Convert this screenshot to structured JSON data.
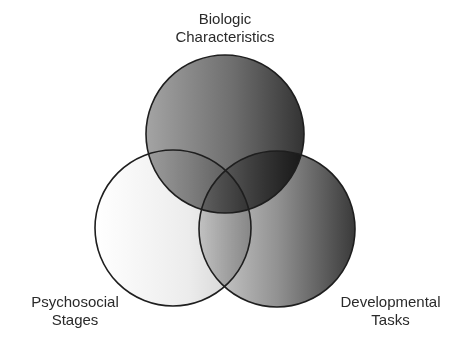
{
  "diagram": {
    "type": "venn",
    "sets": [
      {
        "id": "biologic",
        "label_lines": [
          "Biologic",
          "Characteristics"
        ],
        "position": "top",
        "center": [
          225,
          134
        ],
        "radius": 79,
        "gradient": [
          "#a2a2a2",
          "#353535"
        ]
      },
      {
        "id": "psychosocial",
        "label_lines": [
          "Psychosocial",
          "Stages"
        ],
        "position": "bottom-left",
        "center": [
          173,
          228
        ],
        "radius": 78,
        "gradient": [
          "#ffffff",
          "#cfcfcf"
        ]
      },
      {
        "id": "developmental",
        "label_lines": [
          "Developmental",
          "Tasks"
        ],
        "position": "bottom-right",
        "center": [
          277,
          229
        ],
        "radius": 78,
        "gradient": [
          "#d0d0d0",
          "#3c3c3c"
        ]
      }
    ],
    "stroke_color": "#1e1e1e",
    "background": "#ffffff"
  }
}
